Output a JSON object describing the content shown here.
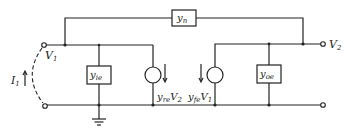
{
  "diagram": {
    "type": "hybrid-pi / y-parameter equivalent circuit",
    "components": {
      "feedback_admittance": {
        "base": "y",
        "sub": "n"
      },
      "input_admittance": {
        "base": "y",
        "sub": "ie"
      },
      "output_admittance": {
        "base": "y",
        "sub": "oe"
      },
      "reverse_source": {
        "base": "y",
        "sub": "re",
        "var": "V",
        "var_sub": "2"
      },
      "forward_source": {
        "base": "y",
        "sub": "fe",
        "var": "V",
        "var_sub": "1"
      }
    },
    "terminals": {
      "input_voltage": {
        "base": "V",
        "sub": "1"
      },
      "output_voltage": {
        "base": "V",
        "sub": "2"
      },
      "input_current": {
        "base": "I",
        "sub": "1"
      }
    },
    "ground": "ground-symbol"
  }
}
